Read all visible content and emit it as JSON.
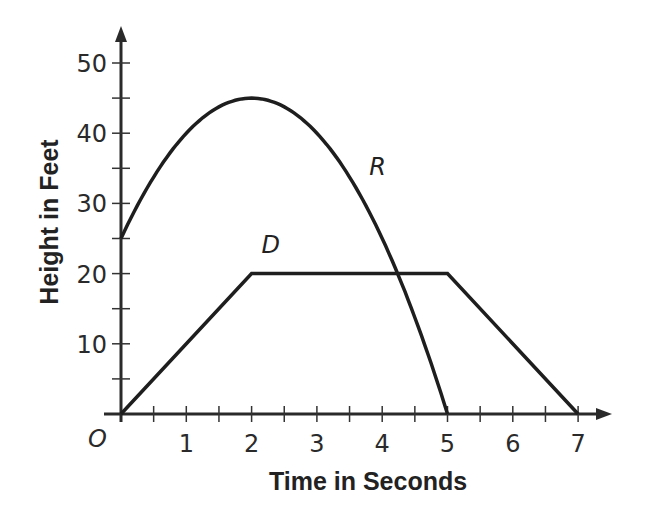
{
  "chart_data": {
    "type": "line",
    "title": "",
    "xlabel": "Time in Seconds",
    "ylabel": "Height in Feet",
    "xlim": [
      0,
      7.5
    ],
    "ylim": [
      0,
      52
    ],
    "x_ticks": [
      1,
      2,
      3,
      4,
      5,
      6,
      7
    ],
    "x_minor_step": 0.5,
    "y_ticks": [
      10,
      20,
      30,
      40,
      50
    ],
    "y_minor_step": 5,
    "origin_label": "O",
    "grid": false,
    "legend": "none (inline curve labels)",
    "series": [
      {
        "name": "R",
        "kind": "parabola",
        "formula": "h = -5(t-2)^2 + 45",
        "x": [
          0,
          0.5,
          1,
          1.5,
          2,
          2.5,
          3,
          3.5,
          4,
          4.5,
          5
        ],
        "values": [
          25,
          33.75,
          40,
          43.75,
          45,
          43.75,
          40,
          33.75,
          25,
          13.75,
          0
        ],
        "label_position": {
          "t": 3.8,
          "h": 34
        }
      },
      {
        "name": "D",
        "kind": "piecewise-linear",
        "x": [
          0,
          2,
          5,
          7
        ],
        "values": [
          0,
          20,
          20,
          0
        ],
        "label_position": {
          "t": 2.15,
          "h": 23
        }
      }
    ]
  }
}
